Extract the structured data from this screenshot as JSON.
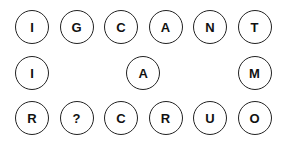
{
  "puzzle": {
    "rows": [
      {
        "y": 27,
        "tiles": [
          {
            "col": 0,
            "letter": "I"
          },
          {
            "col": 1,
            "letter": "G"
          },
          {
            "col": 2,
            "letter": "C"
          },
          {
            "col": 3,
            "letter": "A"
          },
          {
            "col": 4,
            "letter": "N"
          },
          {
            "col": 5,
            "letter": "T"
          }
        ]
      },
      {
        "y": 73,
        "tiles": [
          {
            "col": 0,
            "letter": "I"
          },
          {
            "col": 2.5,
            "letter": "A"
          },
          {
            "col": 5,
            "letter": "M"
          }
        ]
      },
      {
        "y": 118,
        "tiles": [
          {
            "col": 0,
            "letter": "R"
          },
          {
            "col": 1,
            "letter": "?"
          },
          {
            "col": 2,
            "letter": "C"
          },
          {
            "col": 3,
            "letter": "R"
          },
          {
            "col": 4,
            "letter": "U"
          },
          {
            "col": 5,
            "letter": "O"
          }
        ]
      }
    ]
  }
}
